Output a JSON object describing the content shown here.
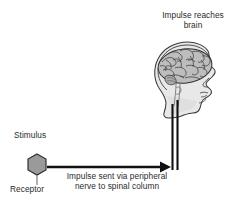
{
  "diagram": {
    "background_color": "#ffffff",
    "text_color": "#2b2b2b",
    "line_color": "#1a1a1a",
    "receptor_fill_color": "#9a9a9a",
    "head_fill_color": "#e8e8e8",
    "brain_fill_color": "#bdbdbd",
    "labels": {
      "impulse_reaches_brain_line1": "Impulse reaches",
      "impulse_reaches_brain_line2": "brain",
      "stimulus": "Stimulus",
      "receptor": "Receptor",
      "impulse_peripheral_line1": "Impulse sent via peripheral",
      "impulse_peripheral_line2": "nerve to spinal column"
    },
    "shapes": {
      "receptor_shape": "hexagon",
      "head_shape": "human-head-profile-facing-right",
      "brain_shape": "brain-cross-section",
      "spinal_column_shape": "double-vertical-line",
      "nerve_arrow_shape": "horizontal-arrow-pointing-right"
    }
  }
}
